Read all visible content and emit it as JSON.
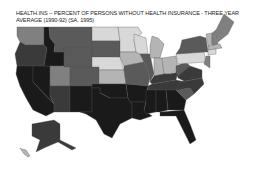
{
  "title_line1": "HEALTH.INS -- PERCENT OF PERSONS WITHOUT HEALTH INSURANCE - THREE YEAR",
  "title_line2": "AVERAGE (1990-92) (SA, 1995)",
  "shades": {
    "darkest": "#1a1a1a",
    "dark": "#3a3a3a",
    "mid_dark": "#5a5a5a",
    "mid": "#808080",
    "light": "#b4b4b4",
    "lightest": "#d8d8d8"
  },
  "states": [
    {
      "id": "WA",
      "class": "mid"
    },
    {
      "id": "OR",
      "class": "dark"
    },
    {
      "id": "CA",
      "class": "darkest"
    },
    {
      "id": "NV",
      "class": "darkest"
    },
    {
      "id": "ID",
      "class": "darkest"
    },
    {
      "id": "MT",
      "class": "mid_dark"
    },
    {
      "id": "WY",
      "class": "mid_dark"
    },
    {
      "id": "UT",
      "class": "mid"
    },
    {
      "id": "AZ",
      "class": "dark"
    },
    {
      "id": "CO",
      "class": "mid_dark"
    },
    {
      "id": "NM",
      "class": "darkest"
    },
    {
      "id": "ND",
      "class": "lightest"
    },
    {
      "id": "SD",
      "class": "mid_dark"
    },
    {
      "id": "NE",
      "class": "lightest"
    },
    {
      "id": "KS",
      "class": "light"
    },
    {
      "id": "OK",
      "class": "darkest"
    },
    {
      "id": "TX",
      "class": "darkest"
    },
    {
      "id": "MN",
      "class": "lightest"
    },
    {
      "id": "IA",
      "class": "light"
    },
    {
      "id": "MO",
      "class": "mid_dark"
    },
    {
      "id": "AR",
      "class": "darkest"
    },
    {
      "id": "LA",
      "class": "darkest"
    },
    {
      "id": "WI",
      "class": "lightest"
    },
    {
      "id": "IL",
      "class": "mid_dark"
    },
    {
      "id": "MI",
      "class": "light"
    },
    {
      "id": "IN",
      "class": "light"
    },
    {
      "id": "OH",
      "class": "light"
    },
    {
      "id": "KY",
      "class": "dark"
    },
    {
      "id": "TN",
      "class": "dark"
    },
    {
      "id": "MS",
      "class": "darkest"
    },
    {
      "id": "AL",
      "class": "darkest"
    },
    {
      "id": "GA",
      "class": "darkest"
    },
    {
      "id": "FL",
      "class": "darkest"
    },
    {
      "id": "SC",
      "class": "mid_dark"
    },
    {
      "id": "NC",
      "class": "dark"
    },
    {
      "id": "VA",
      "class": "dark"
    },
    {
      "id": "WV",
      "class": "mid_dark"
    },
    {
      "id": "PA",
      "class": "lightest"
    },
    {
      "id": "NY",
      "class": "mid_dark"
    },
    {
      "id": "VT",
      "class": "light"
    },
    {
      "id": "NH",
      "class": "mid"
    },
    {
      "id": "ME",
      "class": "mid"
    },
    {
      "id": "MA",
      "class": "light"
    },
    {
      "id": "CT",
      "class": "lightest"
    },
    {
      "id": "NJ",
      "class": "mid"
    },
    {
      "id": "AK",
      "class": "dark"
    },
    {
      "id": "HI",
      "class": "light"
    }
  ]
}
